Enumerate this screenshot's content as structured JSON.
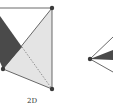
{
  "figure": {
    "caption": "2D",
    "colors": {
      "dark_fill": "#4a4a4a",
      "light_fill": "#e4e4e4",
      "line": "#444444",
      "node": "#3a3a3a"
    },
    "left_diagram": {
      "nodes": [
        {
          "id": "top-right",
          "x": 52,
          "y": 8
        },
        {
          "id": "bottom-right",
          "x": 52,
          "y": 89
        },
        {
          "id": "left",
          "x": 3,
          "y": 69
        }
      ],
      "dark_polygon": "0,16 22,47 3,69 0,62",
      "light_polygon": "3,69 52,8 52,89",
      "top_edge": {
        "x1": 0,
        "y1": 8,
        "x2": 52,
        "y2": 8
      },
      "dashed_edge": {
        "x1": 22,
        "y1": 47,
        "x2": 52,
        "y2": 89
      }
    },
    "right_diagram": {
      "node": {
        "x": 90,
        "y": 59
      },
      "dark_wedge": "90,59 113,50 113,60",
      "upper_ray": {
        "x2": 113,
        "y2": 37
      },
      "lower_ray": {
        "x2": 113,
        "y2": 72
      }
    }
  }
}
